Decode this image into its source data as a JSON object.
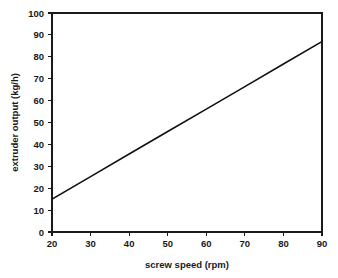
{
  "chart_data": {
    "type": "line",
    "title": "",
    "xlabel": "screw speed (rpm)",
    "ylabel": "extruder output (kg/h)",
    "xlim": [
      20,
      90
    ],
    "ylim": [
      0,
      100
    ],
    "grid": false,
    "legend": false,
    "x_ticks": [
      20,
      30,
      40,
      50,
      60,
      70,
      80,
      90
    ],
    "y_ticks": [
      0,
      10,
      20,
      30,
      40,
      50,
      60,
      70,
      80,
      90,
      100
    ],
    "x_tick_labels": [
      "20",
      "30",
      "40",
      "50",
      "60",
      "70",
      "80",
      "90"
    ],
    "y_tick_labels": [
      "0",
      "10",
      "20",
      "30",
      "40",
      "50",
      "60",
      "70",
      "80",
      "90",
      "100"
    ],
    "line_color": "#111111",
    "series": [
      {
        "name": "extruder output",
        "x": [
          20,
          30,
          40,
          50,
          60,
          70,
          80,
          90
        ],
        "values": [
          15,
          25.3,
          35.6,
          45.9,
          56.1,
          66.4,
          76.7,
          87
        ]
      }
    ]
  },
  "axes": {
    "x_title": "screw speed (rpm)",
    "y_title": "extruder output (kg/h)"
  },
  "yticks": {
    "t0": "0",
    "t1": "10",
    "t2": "20",
    "t3": "30",
    "t4": "40",
    "t5": "50",
    "t6": "60",
    "t7": "70",
    "t8": "80",
    "t9": "90",
    "t10": "100"
  },
  "xticks": {
    "t0": "20",
    "t1": "30",
    "t2": "40",
    "t3": "50",
    "t4": "60",
    "t5": "70",
    "t6": "80",
    "t7": "90"
  },
  "colors": {
    "background": "#ffffff",
    "axis": "#1a1a1a",
    "line": "#111111"
  }
}
